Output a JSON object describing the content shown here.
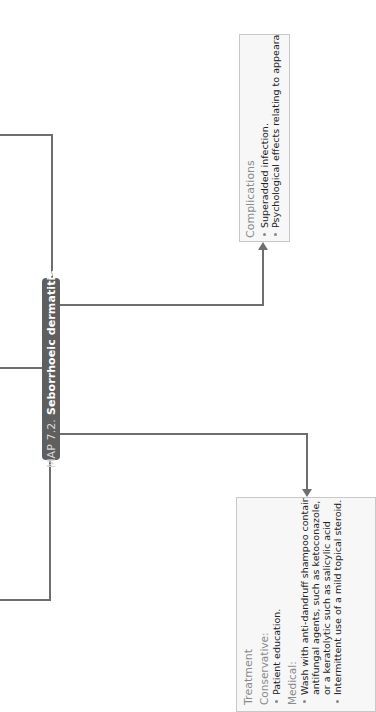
{
  "diagram": {
    "orientation": "rotated 90 degrees counterclockwise",
    "central_node": {
      "map_number": "MAP 7.2.",
      "title": "Seborrhoeic dermatitis",
      "fill_color": "#5f5f5f",
      "text_color": "#ffffff"
    },
    "complications": {
      "heading": "Complications",
      "items": [
        "Superadded infection.",
        "Psychological effects relating to appearance."
      ]
    },
    "treatment": {
      "heading": "Treatment",
      "sections": [
        {
          "label": "Conservative:",
          "items": [
            "Patient education."
          ]
        },
        {
          "label": "Medical:",
          "items": [
            "Wash with anti-dandruff shampoo containing antifungal agents, such as ketoconazole, or a keratolytic such as salicylic acid",
            "Intermittent use of a mild topical steroid."
          ]
        }
      ],
      "medical_item_1_lines": [
        "Wash with anti-dandruff shampoo containing",
        "antifungal agents, such as ketoconazole,",
        "or a keratolytic such as salicylic acid"
      ]
    },
    "connector_color": "#6e6e6e",
    "box_fill": "#f7f7f7",
    "box_border": "#c8c8c8",
    "heading_color": "#8a8a8a"
  }
}
